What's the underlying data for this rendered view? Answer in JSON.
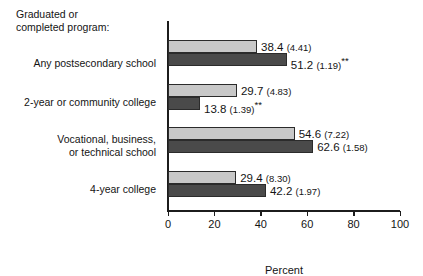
{
  "heading": "Graduated or\ncompleted program:",
  "axis_title": "Percent",
  "colors": {
    "series1": "#c8c8c8",
    "series2": "#4a4a4a",
    "axis": "#1c1c1c",
    "text": "#141414"
  },
  "ticks": [
    {
      "label": "0",
      "value": 0
    },
    {
      "label": "20",
      "value": 20
    },
    {
      "label": "40",
      "value": 40
    },
    {
      "label": "60",
      "value": 60
    },
    {
      "label": "80",
      "value": 80
    },
    {
      "label": "100",
      "value": 100
    }
  ],
  "categories": [
    {
      "label": "Any postsecondary school"
    },
    {
      "label": "2-year or community college"
    },
    {
      "label": "Vocational, business,\nor technical school"
    },
    {
      "label": "4-year college"
    }
  ],
  "bars": [
    {
      "group": 0,
      "series": 0,
      "value": 38.4,
      "estimate": "38.4",
      "se": "(4.41)",
      "stars": ""
    },
    {
      "group": 0,
      "series": 1,
      "value": 51.2,
      "estimate": "51.2",
      "se": "(1.19)",
      "stars": "**"
    },
    {
      "group": 1,
      "series": 0,
      "value": 29.7,
      "estimate": "29.7",
      "se": "(4.83)",
      "stars": ""
    },
    {
      "group": 1,
      "series": 1,
      "value": 13.8,
      "estimate": "13.8",
      "se": "(1.39)",
      "stars": "**"
    },
    {
      "group": 2,
      "series": 0,
      "value": 54.6,
      "estimate": "54.6",
      "se": "(7.22)",
      "stars": ""
    },
    {
      "group": 2,
      "series": 1,
      "value": 62.6,
      "estimate": "62.6",
      "se": "(1.58)",
      "stars": ""
    },
    {
      "group": 3,
      "series": 0,
      "value": 29.4,
      "estimate": "29.4",
      "se": "(8.30)",
      "stars": ""
    },
    {
      "group": 3,
      "series": 1,
      "value": 42.2,
      "estimate": "42.2",
      "se": "(1.97)",
      "stars": ""
    }
  ],
  "chart_data": {
    "type": "bar",
    "orientation": "horizontal",
    "title": "Graduated or completed program:",
    "xlabel": "Percent",
    "ylabel": "",
    "xlim": [
      0,
      100
    ],
    "xticks": [
      0,
      20,
      40,
      60,
      80,
      100
    ],
    "grid": false,
    "legend": "none",
    "categories": [
      "Any postsecondary school",
      "2-year or community college",
      "Vocational, business, or technical school",
      "4-year college"
    ],
    "series": [
      {
        "name": "series-1-light",
        "color": "#c8c8c8",
        "values": [
          38.4,
          29.7,
          54.6,
          29.4
        ],
        "standard_errors": [
          4.41,
          4.83,
          7.22,
          8.3
        ],
        "significance": [
          "",
          "",
          "",
          ""
        ]
      },
      {
        "name": "series-2-dark",
        "color": "#4a4a4a",
        "values": [
          51.2,
          13.8,
          62.6,
          42.2
        ],
        "standard_errors": [
          1.19,
          1.39,
          1.58,
          1.97
        ],
        "significance": [
          "**",
          "**",
          "",
          ""
        ]
      }
    ],
    "data_labels": [
      "38.4 (4.41)",
      "51.2 (1.19)**",
      "29.7 (4.83)",
      "13.8 (1.39)**",
      "54.6 (7.22)",
      "62.6 (1.58)",
      "29.4 (8.30)",
      "42.2 (1.97)"
    ]
  }
}
